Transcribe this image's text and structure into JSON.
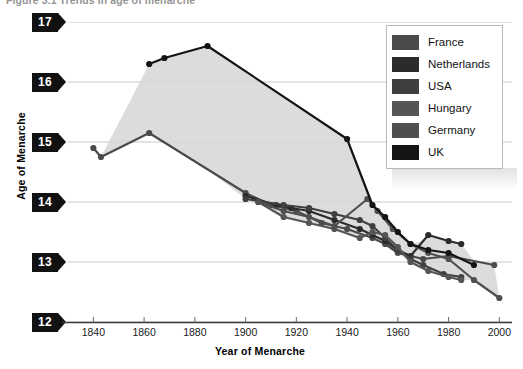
{
  "figure": {
    "title": "Figure 3.1  Trends in age of menarche"
  },
  "axes": {
    "y_title": "Age of Menarche",
    "x_title": "Year of Menarche",
    "y_ticks": [
      "17",
      "16",
      "15",
      "14",
      "13",
      "12"
    ],
    "x_ticks": [
      "1840",
      "1860",
      "1880",
      "1900",
      "1920",
      "1940",
      "1960",
      "1980",
      "2000"
    ]
  },
  "legend": {
    "items": [
      {
        "label": "France",
        "color": "#4a4a4a"
      },
      {
        "label": "Netherlands",
        "color": "#2b2b2b"
      },
      {
        "label": "USA",
        "color": "#3f3f3f"
      },
      {
        "label": "Hungary",
        "color": "#555555"
      },
      {
        "label": "Germany",
        "color": "#4f4f4f"
      },
      {
        "label": "UK",
        "color": "#141414"
      }
    ]
  },
  "chart_data": {
    "type": "line",
    "title": "Figure 3.1  Trends in age of menarche",
    "xlabel": "Year of Menarche",
    "ylabel": "Age of Menarche",
    "xlim": [
      1830,
      2005
    ],
    "ylim": [
      12,
      17
    ],
    "grid": true,
    "legend_position": "top-right",
    "band": {
      "description": "light grey shaded band spanning the envelope between the highest and lowest series",
      "color": "#d6d6d6"
    },
    "series": [
      {
        "name": "France",
        "color": "#4a4a4a",
        "points": [
          [
            1840,
            14.9
          ],
          [
            1843,
            14.75
          ],
          [
            1862,
            15.15
          ],
          [
            1900,
            14.15
          ],
          [
            1910,
            13.95
          ],
          [
            1920,
            13.85
          ],
          [
            1930,
            13.65
          ],
          [
            1940,
            13.55
          ],
          [
            1950,
            13.4
          ],
          [
            1955,
            13.3
          ],
          [
            1960,
            13.15
          ],
          [
            1970,
            13.05
          ],
          [
            1980,
            13.1
          ],
          [
            1998,
            12.95
          ]
        ]
      },
      {
        "name": "Netherlands",
        "color": "#2b2b2b",
        "points": [
          [
            1900,
            14.1
          ],
          [
            1912,
            13.95
          ],
          [
            1918,
            13.9
          ],
          [
            1925,
            13.85
          ],
          [
            1935,
            13.7
          ],
          [
            1945,
            13.55
          ],
          [
            1950,
            13.45
          ],
          [
            1955,
            13.35
          ],
          [
            1960,
            13.2
          ],
          [
            1965,
            13.1
          ],
          [
            1972,
            13.45
          ],
          [
            1980,
            13.35
          ],
          [
            1985,
            13.3
          ]
        ]
      },
      {
        "name": "USA",
        "color": "#3f3f3f",
        "points": [
          [
            1900,
            14.05
          ],
          [
            1915,
            13.95
          ],
          [
            1925,
            13.9
          ],
          [
            1935,
            13.8
          ],
          [
            1945,
            13.7
          ],
          [
            1950,
            13.6
          ],
          [
            1955,
            13.4
          ],
          [
            1960,
            13.2
          ],
          [
            1965,
            13.05
          ],
          [
            1970,
            12.95
          ],
          [
            1978,
            12.8
          ],
          [
            1985,
            12.75
          ]
        ]
      },
      {
        "name": "Hungary",
        "color": "#555555",
        "points": [
          [
            1905,
            14.0
          ],
          [
            1915,
            13.75
          ],
          [
            1925,
            13.65
          ],
          [
            1935,
            13.55
          ],
          [
            1945,
            13.4
          ],
          [
            1950,
            13.5
          ],
          [
            1955,
            13.45
          ],
          [
            1960,
            13.25
          ],
          [
            1965,
            13.0
          ],
          [
            1972,
            12.85
          ],
          [
            1980,
            12.75
          ],
          [
            1985,
            12.7
          ]
        ]
      },
      {
        "name": "Germany",
        "color": "#4f4f4f",
        "points": [
          [
            1905,
            14.0
          ],
          [
            1915,
            13.85
          ],
          [
            1925,
            13.75
          ],
          [
            1935,
            13.6
          ],
          [
            1948,
            14.05
          ],
          [
            1952,
            13.85
          ],
          [
            1958,
            13.55
          ],
          [
            1965,
            13.3
          ],
          [
            1972,
            13.15
          ],
          [
            1980,
            13.05
          ],
          [
            1990,
            12.7
          ],
          [
            2000,
            12.4
          ]
        ]
      },
      {
        "name": "UK",
        "color": "#141414",
        "points": [
          [
            1862,
            16.3
          ],
          [
            1868,
            16.4
          ],
          [
            1885,
            16.6
          ],
          [
            1940,
            15.05
          ],
          [
            1950,
            13.95
          ],
          [
            1955,
            13.75
          ],
          [
            1960,
            13.5
          ],
          [
            1965,
            13.3
          ],
          [
            1972,
            13.2
          ],
          [
            1980,
            13.15
          ],
          [
            1990,
            12.95
          ]
        ]
      }
    ]
  }
}
